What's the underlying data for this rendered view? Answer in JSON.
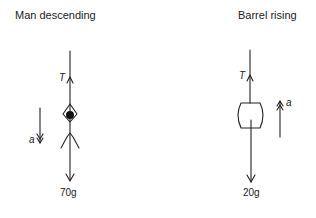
{
  "diagrams": [
    {
      "title": "Man descending",
      "tension_label": "T",
      "accel_label": "a",
      "weight_label": "70g",
      "accel_direction": "down"
    },
    {
      "title": "Barrel rising",
      "tension_label": "T",
      "accel_label": "a",
      "weight_label": "20g",
      "accel_direction": "up"
    }
  ],
  "colors": {
    "stroke": "#222222"
  }
}
